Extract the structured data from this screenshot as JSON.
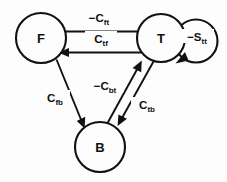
{
  "diagram": {
    "background_color": "#fdfdfd",
    "line_color": "#111111",
    "nodes": [
      {
        "id": "F",
        "label": "F",
        "cx": 41,
        "cy": 38,
        "r": 25
      },
      {
        "id": "T",
        "label": "T",
        "cx": 161,
        "cy": 38,
        "r": 24
      },
      {
        "id": "B",
        "label": "B",
        "cx": 100,
        "cy": 147,
        "r": 25
      }
    ],
    "edges": [
      {
        "id": "f-to-t",
        "from": "F",
        "to": "T",
        "label_main": "−C",
        "label_sub": "ft",
        "label_full": "-Cft",
        "direction": "right"
      },
      {
        "id": "t-to-f",
        "from": "T",
        "to": "F",
        "label_main": "C",
        "label_sub": "tf",
        "label_full": "Ctf",
        "direction": "left"
      },
      {
        "id": "f-to-b",
        "from": "F",
        "to": "B",
        "label_main": "C",
        "label_sub": "fb",
        "label_full": "Cfb",
        "direction": "down-right"
      },
      {
        "id": "b-to-t",
        "from": "B",
        "to": "T",
        "label_main": "−C",
        "label_sub": "bt",
        "label_full": "-Cbt",
        "direction": "up-right"
      },
      {
        "id": "t-to-b",
        "from": "T",
        "to": "B",
        "label_main": "C",
        "label_sub": "tb",
        "label_full": "Ctb",
        "direction": "down-left"
      },
      {
        "id": "t-self-loop",
        "from": "T",
        "to": "T",
        "label_main": "−S",
        "label_sub": "tt",
        "label_full": "-Stt",
        "direction": "self"
      }
    ]
  }
}
